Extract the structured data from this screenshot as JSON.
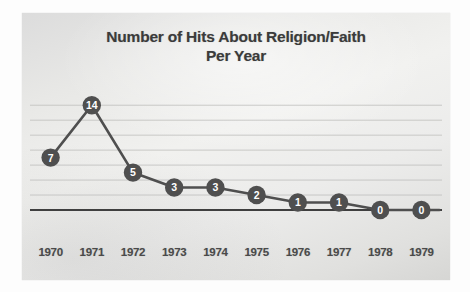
{
  "chart_data": {
    "type": "line",
    "title": "Number of Hits About Religion/Faith Per Year",
    "title_lines": [
      "Number of Hits About Religion/Faith",
      "Per Year"
    ],
    "xlabel": "",
    "ylabel": "",
    "categories": [
      "1970",
      "1971",
      "1972",
      "1973",
      "1974",
      "1975",
      "1976",
      "1977",
      "1978",
      "1979"
    ],
    "values": [
      7,
      14,
      5,
      3,
      3,
      2,
      1,
      1,
      0,
      0
    ],
    "point_labels": [
      "7",
      "14",
      "5",
      "3",
      "3",
      "2",
      "1",
      "1",
      "0",
      "0"
    ],
    "ylim": [
      0,
      15.5
    ],
    "y_gridlines": [
      2,
      4,
      6,
      8,
      10,
      12,
      14
    ],
    "y_tick_labels_visible": false,
    "grid": true,
    "legend": false,
    "legend_position": "none",
    "marker": "circle",
    "marker_label_color": "#ffffff",
    "series_color": "#4f4f4f",
    "gridline_color": "#c2c2c0",
    "axis_color": "#3f3f3f",
    "panel_color": "#e9e9e7",
    "title_color": "#3b3b3b",
    "tick_label_color": "#4a4a4a"
  }
}
